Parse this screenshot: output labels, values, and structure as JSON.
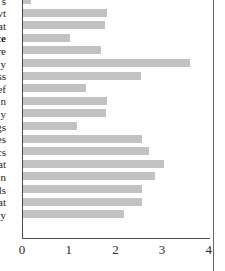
{
  "chart_data": {
    "type": "bar",
    "orientation": "horizontal",
    "title": "",
    "xlabel": "",
    "ylabel": "",
    "xlim": [
      0,
      4
    ],
    "xticks": [
      0,
      1,
      2,
      3,
      4
    ],
    "xtick_labels": [
      "0",
      "1",
      "2",
      "3",
      "4"
    ],
    "grid": false,
    "legend": null,
    "bar_color": "#c2c2c2",
    "axis_color": "#4a4a4a",
    "note": "Category labels are clipped at the left edge of the crop; only the trailing characters are visible.",
    "categories": [
      "s",
      "vt",
      "at",
      "ce",
      "re",
      "y",
      "ss",
      "ef",
      "n",
      "y",
      "gs",
      "es",
      "cs",
      "at",
      "n",
      "ls",
      "at",
      "y"
    ],
    "values": [
      0.18,
      1.8,
      1.76,
      1.0,
      1.67,
      3.57,
      2.53,
      1.35,
      1.8,
      1.78,
      1.15,
      2.54,
      2.7,
      3.02,
      2.83,
      2.54,
      2.54,
      2.17
    ],
    "bold_categories": [
      "ce"
    ]
  }
}
